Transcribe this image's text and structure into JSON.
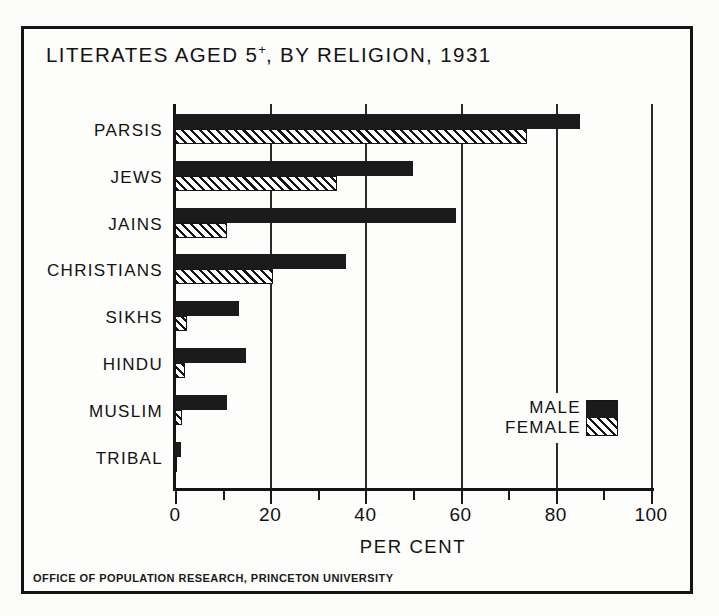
{
  "figure": {
    "title_main": "LITERATES AGED 5",
    "title_sup": "+",
    "title_rest": ", BY RELIGION, 1931",
    "footer": "OFFICE OF POPULATION RESEARCH, PRINCETON UNIVERSITY"
  },
  "legend": {
    "male_label": "MALE",
    "female_label": "FEMALE"
  },
  "chart_data": {
    "type": "bar",
    "orientation": "horizontal",
    "title": "LITERATES AGED 5+, BY RELIGION, 1931",
    "xlabel": "PER CENT",
    "ylabel": "",
    "xlim": [
      0,
      100
    ],
    "grid": true,
    "grid_axis": "x",
    "legend_position": "inside-lower-right",
    "major_tick_step": 20,
    "minor_tick_step": 10,
    "tick_labels": [
      "0",
      "20",
      "40",
      "60",
      "80",
      "100"
    ],
    "tick_values": [
      0,
      20,
      40,
      60,
      80,
      100
    ],
    "categories": [
      "PARSIS",
      "JEWS",
      "JAINS",
      "CHRISTIANS",
      "SIKHS",
      "HINDU",
      "MUSLIM",
      "TRIBAL"
    ],
    "series": [
      {
        "name": "MALE",
        "color": "#1b1b1b",
        "pattern": "solid",
        "values": [
          85,
          50,
          59,
          36,
          13.5,
          15,
          11,
          1.2
        ]
      },
      {
        "name": "FEMALE",
        "color": "#151515",
        "pattern": "diagonal-hatch",
        "values": [
          74,
          34,
          11,
          20.5,
          2.5,
          2,
          1.5,
          0.2
        ]
      }
    ]
  }
}
